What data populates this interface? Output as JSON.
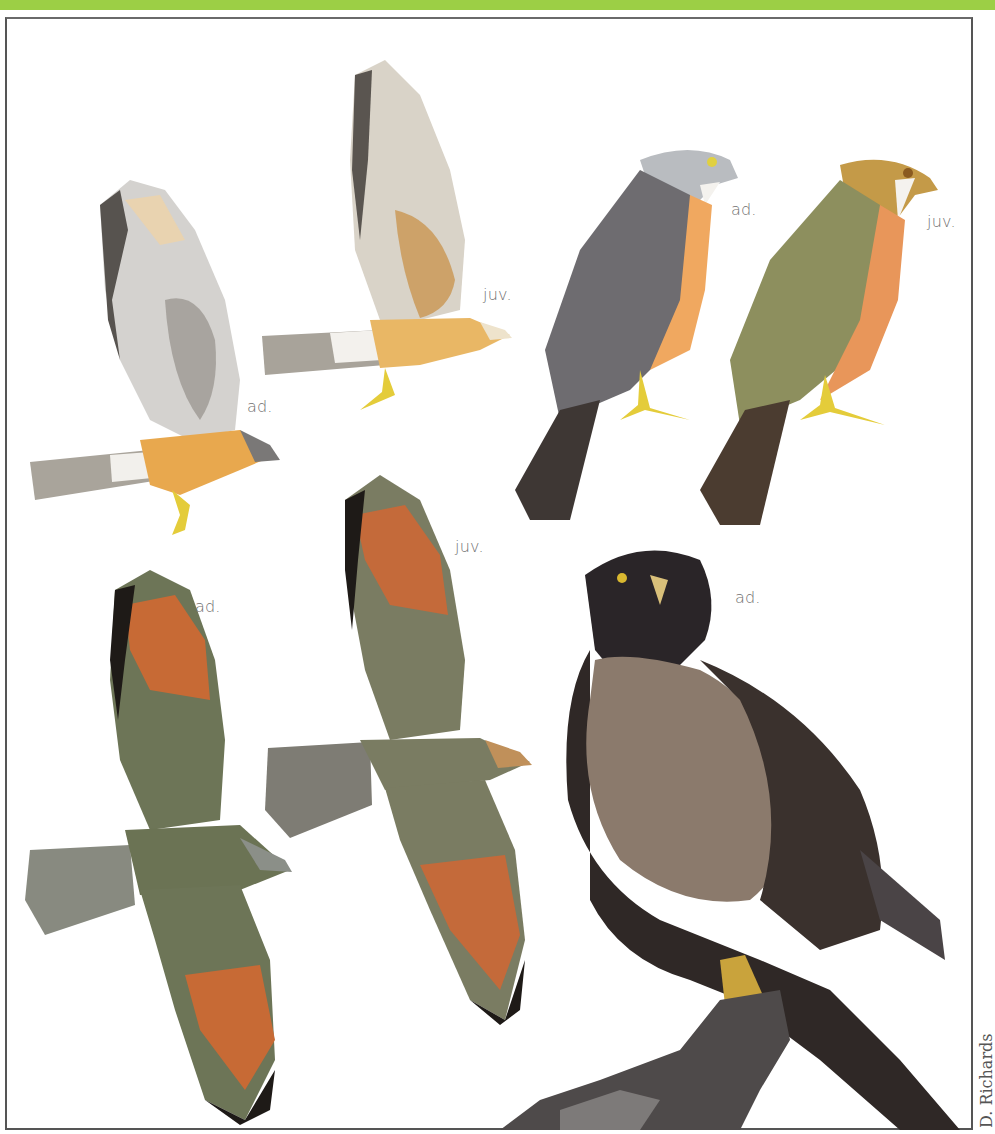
{
  "header": {
    "accent_color": "#9ccf45"
  },
  "plate": {
    "figures": [
      {
        "id": "flight-ad-upper",
        "label": "ad.",
        "pose": "flying, side view, underwing",
        "colors": {
          "body": "#e8a84e",
          "wing": "#cfcfcf",
          "tail": "#a9a49b"
        }
      },
      {
        "id": "flight-juv-upper",
        "label": "juv.",
        "pose": "flying, side view, underwing",
        "colors": {
          "body": "#e9b765",
          "wing": "#d9d3c8",
          "tail": "#a8a39a"
        }
      },
      {
        "id": "perched-ad-illustration",
        "label": "ad.",
        "pose": "perched, profile",
        "colors": {
          "head": "#b9bcc0",
          "back": "#6e6c70",
          "breast": "#f0a860",
          "legs": "#e4cc3a"
        }
      },
      {
        "id": "perched-juv-illustration",
        "label": "juv.",
        "pose": "perched, profile",
        "colors": {
          "head": "#c49a48",
          "back": "#8d8f5e",
          "breast": "#e8965a",
          "legs": "#e4cc3a"
        }
      },
      {
        "id": "soaring-ad",
        "label": "ad.",
        "pose": "soaring, dorsal view",
        "colors": {
          "body": "#6d7557",
          "primaries": "#c76a35",
          "tips": "#1e1a17",
          "tail": "#888a80"
        }
      },
      {
        "id": "soaring-juv",
        "label": "juv.",
        "pose": "soaring, dorsal view",
        "colors": {
          "body": "#7a7c62",
          "primaries": "#c46a3a",
          "tips": "#1e1a17",
          "head": "#c0905a"
        }
      },
      {
        "id": "photo-ad",
        "label": "ad.",
        "pose": "photograph, perched on branch",
        "colors": {
          "head": "#2a2528",
          "breast": "#8b7a6c",
          "back": "#2f2826",
          "feet": "#c9a33c"
        }
      }
    ],
    "credit": "D. Richards"
  }
}
